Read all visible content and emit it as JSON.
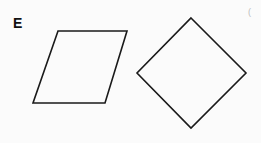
{
  "figure": {
    "label": "E",
    "artifact_mark": "(",
    "stroke_color": "#1a1a1a",
    "shapes": [
      {
        "name": "parallelogram",
        "points": "58,31 127,31 105,103 33,103"
      },
      {
        "name": "square-rotated-diamond",
        "points": "191,18 246,73 191,128 137,73"
      }
    ]
  }
}
